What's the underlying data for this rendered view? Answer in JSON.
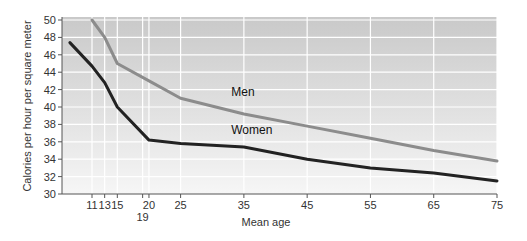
{
  "chart_data": {
    "type": "line",
    "title": "",
    "xlabel": "Mean age",
    "ylabel": "Calories per hour per square meter",
    "xlim": [
      7.5,
      75
    ],
    "ylim": [
      30,
      50
    ],
    "grid": true,
    "legend": "inline labels",
    "x_ticks": [
      11,
      13,
      15,
      19,
      20,
      25,
      35,
      45,
      55,
      65,
      75
    ],
    "x_tick_labels": [
      "11",
      "13",
      "15",
      "19",
      "20",
      "25",
      "35",
      "45",
      "55",
      "65",
      "75"
    ],
    "y_ticks": [
      30,
      32,
      34,
      36,
      38,
      40,
      42,
      44,
      46,
      48,
      50
    ],
    "y_tick_labels": [
      "30",
      "32",
      "34",
      "36",
      "38",
      "40",
      "42",
      "44",
      "46",
      "48",
      "50"
    ],
    "series": [
      {
        "name": "Men",
        "color": "#8c8c8c",
        "x": [
          11,
          13,
          15,
          20,
          25,
          35,
          45,
          55,
          65,
          75
        ],
        "values": [
          50,
          48,
          45,
          43,
          41,
          39.2,
          37.8,
          36.4,
          35,
          33.8
        ],
        "label_pos": {
          "x": 33,
          "y": 41.3
        }
      },
      {
        "name": "Women",
        "color": "#222222",
        "x": [
          7.5,
          11,
          13,
          15,
          20,
          25,
          35,
          45,
          55,
          65,
          75
        ],
        "values": [
          47.4,
          44.7,
          42.8,
          40,
          36.2,
          35.8,
          35.4,
          34,
          33,
          32.4,
          31.5
        ],
        "label_pos": {
          "x": 33,
          "y": 36.9
        }
      }
    ]
  },
  "colors": {
    "plot_bg_top": "#c9c9c9",
    "plot_bg_bottom": "#f6f6f6",
    "grid": "#ffffff",
    "axis": "#555555"
  }
}
